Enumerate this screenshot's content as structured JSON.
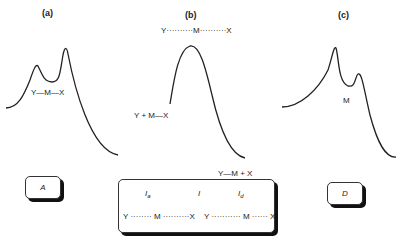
{
  "panels": {
    "a": {
      "label": "(a)",
      "bond_label": {
        "y": "Y",
        "m": "M",
        "x": "X",
        "bond": "—"
      },
      "box_label": "A"
    },
    "b": {
      "label": "(b)",
      "top_label": {
        "y": "Y",
        "m": "M",
        "x": "X",
        "bond": "··········"
      },
      "left_label": "Y + M—X",
      "right_label": "Y—M  + X",
      "box": {
        "headers": [
          {
            "base": "I",
            "sub": "a"
          },
          {
            "base": "I",
            "sub": ""
          },
          {
            "base": "I",
            "sub": "d"
          }
        ],
        "left_formula": "Y ········ M ··········X",
        "right_formula": "Y ··········· M ······ X"
      }
    },
    "c": {
      "label": "(c)",
      "center_label": "M",
      "box_label": "D"
    }
  },
  "colors": {
    "line": "#222222",
    "shadow": "#111111",
    "background": "#ffffff"
  }
}
